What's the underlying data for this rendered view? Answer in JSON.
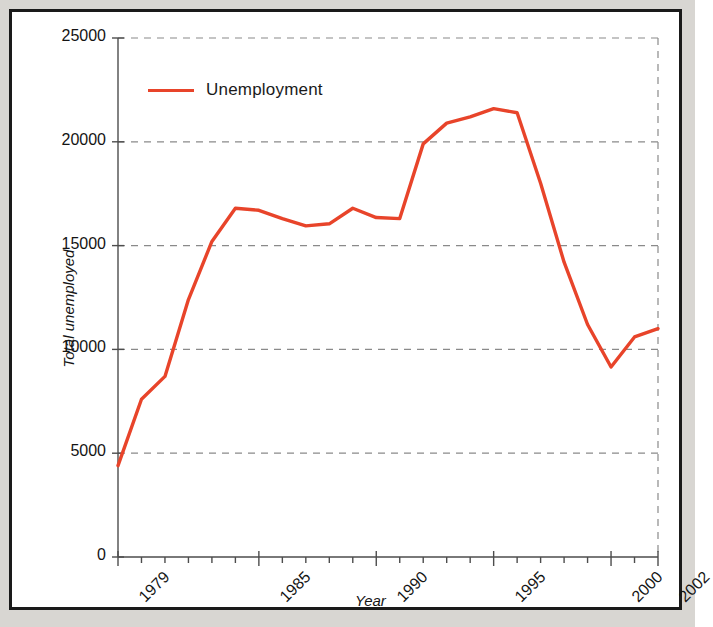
{
  "chart_data": {
    "type": "line",
    "title": "",
    "xlabel": "Year",
    "ylabel": "Total unemployed",
    "legend_position": "top-left-inside",
    "grid": true,
    "grid_style": "dashed-horizontal",
    "series": [
      {
        "name": "Unemployment",
        "color": "#e8442a",
        "x": [
          1979,
          1980,
          1981,
          1982,
          1983,
          1984,
          1985,
          1986,
          1987,
          1988,
          1989,
          1990,
          1991,
          1992,
          1993,
          1994,
          1995,
          1996,
          1997,
          1998,
          1999,
          2000,
          2001,
          2002
        ],
        "values": [
          4400,
          7600,
          8700,
          12400,
          15200,
          16800,
          16700,
          16300,
          15950,
          16050,
          16800,
          16350,
          16300,
          19900,
          20900,
          21200,
          21600,
          21400,
          18000,
          14200,
          11200,
          9150,
          10600,
          11000
        ]
      }
    ],
    "x": [
      1979,
      1980,
      1981,
      1982,
      1983,
      1984,
      1985,
      1986,
      1987,
      1988,
      1989,
      1990,
      1991,
      1992,
      1993,
      1994,
      1995,
      1996,
      1997,
      1998,
      1999,
      2000,
      2001,
      2002
    ],
    "xlim": [
      1979,
      2002
    ],
    "ylim": [
      0,
      25000
    ],
    "yticks": [
      0,
      5000,
      10000,
      15000,
      20000,
      25000
    ],
    "ytick_labels": [
      "0",
      "5000",
      "10000",
      "15000",
      "20000",
      "25000"
    ],
    "xticks": [
      1979,
      1980,
      1981,
      1982,
      1983,
      1984,
      1985,
      1986,
      1987,
      1988,
      1989,
      1990,
      1991,
      1992,
      1993,
      1994,
      1995,
      1996,
      1997,
      1998,
      1999,
      2000,
      2001,
      2002
    ],
    "xtick_labels_shown": [
      "1979",
      "1985",
      "1990",
      "1995",
      "2000",
      "2002"
    ],
    "xtick_labels_shown_values": [
      1979,
      1985,
      1990,
      1995,
      2000,
      2002
    ]
  },
  "legend": {
    "entries": [
      {
        "label": "Unemployment",
        "color": "#e8442a",
        "marker": "line"
      }
    ]
  },
  "axes": {
    "y_title": "Total unemployed",
    "x_title": "Year",
    "y_tick_labels": [
      "25000",
      "20000",
      "15000",
      "10000",
      "5000",
      "0"
    ],
    "x_tick_labels": [
      "1979",
      "1985",
      "1990",
      "1995",
      "2000",
      "2002"
    ]
  },
  "colors": {
    "series": "#e8442a",
    "frame": "#1a1a1a",
    "grid": "#8a8a8a",
    "axis": "#4d4d4d",
    "page_background": "#d8d6d2",
    "plot_background": "#ffffff"
  }
}
